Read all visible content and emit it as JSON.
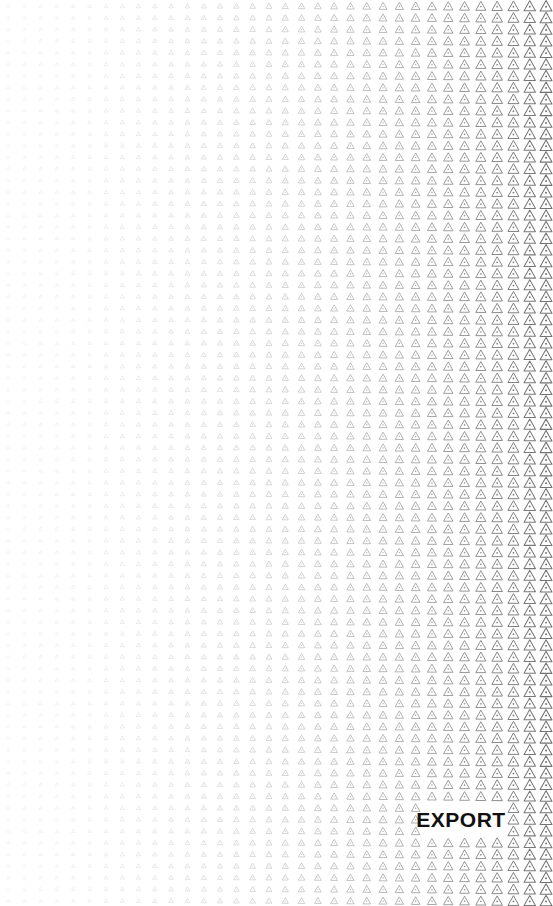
{
  "canvas": {
    "width": 553,
    "height": 906,
    "background_color": "#ffffff"
  },
  "wordmark": {
    "text": "EXPORT",
    "color": "#111111",
    "font_size_px": 21,
    "font_weight": "bold",
    "letter_spacing_px": 0.5,
    "x": 424,
    "y": 806,
    "width": 74,
    "height": 26
  },
  "pattern": {
    "glyph_name": "triangle-outline-icon",
    "description": "grid of triangle outlines with a small dot inside, scaling and darkening from left to right",
    "columns": 34,
    "rows": 78,
    "column_spacing_px": 16.3,
    "row_spacing_px": 11.62,
    "min_glyph_size_px": 3.2,
    "max_glyph_size_px": 11.4,
    "min_stroke_px": 0.55,
    "max_stroke_px": 1.05,
    "min_opacity": 0.1,
    "max_opacity": 0.82,
    "stroke_color": "#555555",
    "gradient_direction": "left-to-right",
    "gradient_easing": "ease-in-quadratic"
  }
}
